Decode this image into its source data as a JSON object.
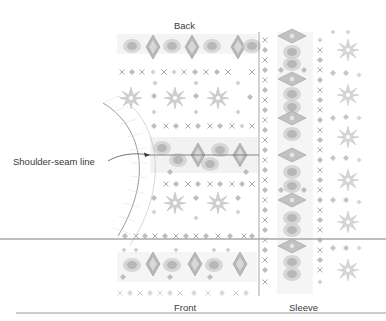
{
  "diagram": {
    "labels": {
      "back": "Back",
      "front": "Front",
      "sleeve": "Sleeve",
      "callout": "Shoulder-seam line"
    },
    "colors": {
      "pattern_dark": "#8a8a8a",
      "pattern_mid": "#b4b4b4",
      "pattern_light": "#d6d6d6",
      "rule": "#9a9a9a",
      "divider": "#7a7a7a",
      "overlay_line": "#a8a8a8"
    },
    "body_rows": [
      {
        "motif": "diamond-band"
      },
      {
        "motif": "x-dot"
      },
      {
        "motif": "star"
      },
      {
        "motif": "dot"
      },
      {
        "motif": "x-dot"
      },
      {
        "motif": "diamond-band"
      },
      {
        "motif": "x-dot"
      },
      {
        "motif": "star"
      },
      {
        "motif": "x-dot"
      },
      {
        "motif": "diamond-band"
      },
      {
        "motif": "x-dot"
      }
    ],
    "sleeve_columns": [
      {
        "motif": "x-dot"
      },
      {
        "motif": "diamond-band"
      },
      {
        "motif": "x-dot"
      },
      {
        "motif": "star"
      }
    ]
  }
}
